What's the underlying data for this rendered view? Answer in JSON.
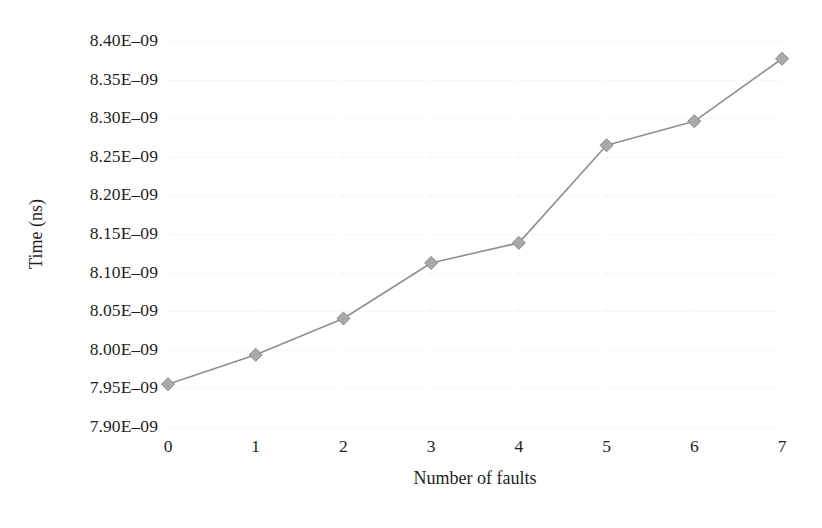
{
  "chart_data": {
    "type": "line",
    "title": "",
    "xlabel": "Number of faults",
    "ylabel": "Time (ns)",
    "x": [
      0,
      1,
      2,
      3,
      4,
      5,
      6,
      7
    ],
    "xtick_labels": [
      "0",
      "1",
      "2",
      "3",
      "4",
      "5",
      "6",
      "7"
    ],
    "xlim": [
      0,
      7
    ],
    "ylim": [
      7.9e-09,
      8.4e-09
    ],
    "ytick_values": [
      7.9e-09,
      7.95e-09,
      8e-09,
      8.05e-09,
      8.1e-09,
      8.15e-09,
      8.2e-09,
      8.25e-09,
      8.3e-09,
      8.35e-09,
      8.4e-09
    ],
    "ytick_labels": [
      "7.90E–09",
      "7.95E–09",
      "8.00E–09",
      "8.05E–09",
      "8.10E–09",
      "8.15E–09",
      "8.20E–09",
      "8.25E–09",
      "8.30E–09",
      "8.35E–09",
      "8.40E–09"
    ],
    "series": [
      {
        "name": "Time",
        "values": [
          7.9555e-09,
          7.9935e-09,
          8.0405e-09,
          8.1125e-09,
          8.1385e-09,
          8.265e-09,
          8.296e-09,
          8.377e-09
        ],
        "line_color": "#8f8f8f",
        "marker": "diamond",
        "marker_color": "#a9a9a9",
        "marker_edge_color": "#8a8a8a"
      }
    ],
    "grid": true,
    "grid_color": "#f0f0f0",
    "legend": false,
    "background": "#ffffff"
  }
}
